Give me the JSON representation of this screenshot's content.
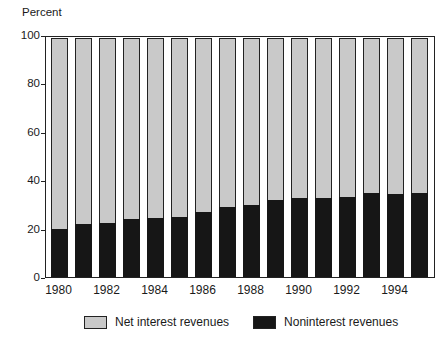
{
  "unit_label": "Percent",
  "colors": {
    "net_interest_fill": "#c9c9c9",
    "noninterest_fill": "#161616",
    "frame": "#222222",
    "background": "#ffffff",
    "text": "#1a1a1a"
  },
  "chart_data": {
    "type": "bar",
    "stacked": true,
    "title": "",
    "ylabel": "Percent",
    "xlabel": "",
    "ylim": [
      0,
      100
    ],
    "yticks": [
      0,
      20,
      40,
      60,
      80,
      100
    ],
    "grid": false,
    "categories": [
      1980,
      1981,
      1982,
      1983,
      1984,
      1985,
      1986,
      1987,
      1988,
      1989,
      1990,
      1991,
      1992,
      1993,
      1994,
      1995
    ],
    "xtick_labels": [
      "1980",
      "1982",
      "1984",
      "1986",
      "1988",
      "1990",
      "1992",
      "1994"
    ],
    "xtick_label_every": 2,
    "series": [
      {
        "name": "Noninterest revenues",
        "color": "#161616",
        "values": [
          20,
          22,
          22.5,
          24,
          24.5,
          25,
          27,
          29,
          30,
          32,
          33,
          33,
          33.5,
          35,
          34.5,
          35
        ]
      },
      {
        "name": "Net interest revenues",
        "color": "#c9c9c9",
        "values": [
          80,
          78,
          77.5,
          76,
          75.5,
          75,
          73,
          71,
          70,
          68,
          67,
          67,
          66.5,
          65,
          65.5,
          65
        ]
      }
    ],
    "legend": [
      {
        "label": "Net interest revenues",
        "color": "#c9c9c9"
      },
      {
        "label": "Noninterest revenues",
        "color": "#161616"
      }
    ],
    "legend_position": "bottom"
  }
}
